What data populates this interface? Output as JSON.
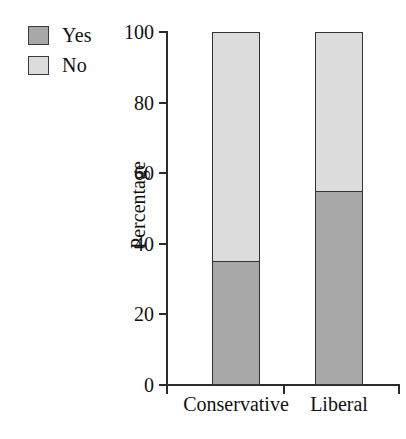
{
  "chart_data": {
    "type": "bar",
    "stacked": true,
    "percent_stacked": true,
    "title": "",
    "xlabel": "",
    "ylabel": "Percentage",
    "categories": [
      "Conservative",
      "Liberal"
    ],
    "series": [
      {
        "name": "Yes",
        "values": [
          35,
          55
        ],
        "color": "#a8a8a8"
      },
      {
        "name": "No",
        "values": [
          65,
          45
        ],
        "color": "#dcdcdc"
      }
    ],
    "ylim": [
      0,
      100
    ],
    "yticks": [
      0,
      20,
      40,
      60,
      80,
      100
    ],
    "ytick_labels": [
      "0",
      "20",
      "40",
      "60",
      "80",
      "100"
    ],
    "grid": false,
    "legend_position": "top-left",
    "legend_entries": [
      "Yes",
      "No"
    ],
    "background_color": "#ffffff",
    "axis_color": "#2b2b2b",
    "bar_edge_color": "#333333"
  },
  "legend": {
    "items": [
      {
        "label": "Yes",
        "color": "#a8a8a8"
      },
      {
        "label": "No",
        "color": "#dcdcdc"
      }
    ]
  },
  "axes": {
    "y_label": "Percentage",
    "y_ticks": [
      "100",
      "80",
      "60",
      "40",
      "20",
      "0"
    ],
    "x_labels": [
      "Conservative",
      "Liberal"
    ]
  }
}
